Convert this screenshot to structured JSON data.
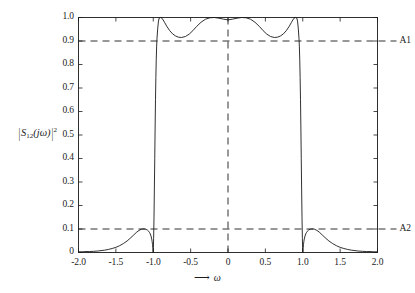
{
  "figure": {
    "background_color": "#ffffff",
    "line_color": "#1a1a1a",
    "text_color": "#1b1b1b"
  },
  "axes": {
    "y_label_parts": {
      "open_bar": "|",
      "s": "S",
      "subscript": "12",
      "arg": "(jω)",
      "close_bar": "|",
      "exponent": "2"
    },
    "x_label_arrow": "⟶",
    "x_label_symbol": "ω"
  },
  "annotations": [
    {
      "name": "A1",
      "label": "A1",
      "y_value": 0.9
    },
    {
      "name": "A2",
      "label": "A2",
      "y_value": 0.1
    }
  ],
  "chart_data": {
    "type": "line",
    "title": "",
    "xlabel": "ω",
    "ylabel": "|S12(jω)|^2",
    "xlim": [
      -2.0,
      2.0
    ],
    "ylim": [
      0.0,
      1.0
    ],
    "grid": false,
    "legend": null,
    "xticks": [
      -2.0,
      -1.5,
      -1.0,
      -0.5,
      0,
      0.5,
      1.0,
      1.5,
      2.0
    ],
    "xtick_labels": [
      "-2.0",
      "-1.5",
      "-1.0",
      "-0.5",
      "0",
      "0.5",
      "1.0",
      "1.5",
      "2.0"
    ],
    "yticks": [
      0,
      0.1,
      0.2,
      0.3,
      0.4,
      0.5,
      0.6,
      0.7,
      0.8,
      0.9,
      1.0
    ],
    "ytick_labels": [
      "0",
      "0.1",
      "0.2",
      "0.3",
      "0.4",
      "0.5",
      "0.6",
      "0.7",
      "0.8",
      "0.9",
      "1.0"
    ],
    "reference_lines": [
      {
        "name": "A1",
        "orientation": "horizontal",
        "value": 0.9,
        "style": "dashed"
      },
      {
        "name": "A2",
        "orientation": "horizontal",
        "value": 0.1,
        "style": "dashed"
      },
      {
        "name": "omega-zero",
        "orientation": "vertical",
        "value": 0,
        "style": "dashed"
      }
    ],
    "series": [
      {
        "name": "|S12(jw)|^2",
        "style": "solid",
        "x": [
          -2.0,
          -1.95,
          -1.9,
          -1.85,
          -1.8,
          -1.75,
          -1.7,
          -1.65,
          -1.6,
          -1.55,
          -1.5,
          -1.45,
          -1.4,
          -1.35,
          -1.3,
          -1.26,
          -1.22,
          -1.19,
          -1.16,
          -1.14,
          -1.12,
          -1.1,
          -1.08,
          -1.06,
          -1.05,
          -1.04,
          -1.03,
          -1.02,
          -1.015,
          -1.01,
          -1.005,
          -1.0,
          -0.998,
          -0.995,
          -0.99,
          -0.985,
          -0.98,
          -0.975,
          -0.97,
          -0.965,
          -0.96,
          -0.955,
          -0.95,
          -0.94,
          -0.93,
          -0.92,
          -0.9,
          -0.88,
          -0.85,
          -0.82,
          -0.78,
          -0.74,
          -0.7,
          -0.66,
          -0.62,
          -0.57,
          -0.52,
          -0.47,
          -0.42,
          -0.36,
          -0.3,
          -0.24,
          -0.18,
          -0.12,
          -0.06,
          0.0,
          0.06,
          0.12,
          0.18,
          0.24,
          0.3,
          0.36,
          0.42,
          0.47,
          0.52,
          0.57,
          0.62,
          0.66,
          0.7,
          0.74,
          0.78,
          0.82,
          0.85,
          0.88,
          0.9,
          0.92,
          0.93,
          0.94,
          0.95,
          0.955,
          0.96,
          0.965,
          0.97,
          0.975,
          0.98,
          0.985,
          0.99,
          0.995,
          0.998,
          1.0,
          1.005,
          1.01,
          1.015,
          1.02,
          1.03,
          1.04,
          1.05,
          1.06,
          1.08,
          1.1,
          1.12,
          1.14,
          1.16,
          1.19,
          1.22,
          1.26,
          1.3,
          1.35,
          1.4,
          1.45,
          1.5,
          1.55,
          1.6,
          1.65,
          1.7,
          1.75,
          1.8,
          1.85,
          1.9,
          1.95,
          2.0
        ],
        "y": [
          0.003,
          0.003,
          0.004,
          0.004,
          0.005,
          0.006,
          0.008,
          0.01,
          0.013,
          0.017,
          0.022,
          0.029,
          0.038,
          0.049,
          0.063,
          0.075,
          0.087,
          0.094,
          0.099,
          0.1,
          0.1,
          0.099,
          0.096,
          0.09,
          0.085,
          0.079,
          0.07,
          0.057,
          0.047,
          0.034,
          0.018,
          0.0,
          0.02,
          0.06,
          0.15,
          0.27,
          0.4,
          0.53,
          0.65,
          0.745,
          0.82,
          0.875,
          0.91,
          0.955,
          0.985,
          0.998,
          1.0,
          0.996,
          0.98,
          0.963,
          0.944,
          0.93,
          0.921,
          0.916,
          0.915,
          0.919,
          0.929,
          0.944,
          0.962,
          0.98,
          0.993,
          0.999,
          1.0,
          0.997,
          0.993,
          0.99,
          0.993,
          0.997,
          1.0,
          0.999,
          0.993,
          0.98,
          0.962,
          0.944,
          0.929,
          0.919,
          0.915,
          0.916,
          0.921,
          0.93,
          0.944,
          0.963,
          0.98,
          0.996,
          1.0,
          0.998,
          0.985,
          0.955,
          0.91,
          0.875,
          0.82,
          0.745,
          0.65,
          0.53,
          0.4,
          0.27,
          0.15,
          0.06,
          0.02,
          0.0,
          0.018,
          0.034,
          0.047,
          0.057,
          0.07,
          0.079,
          0.085,
          0.09,
          0.096,
          0.099,
          0.1,
          0.1,
          0.099,
          0.094,
          0.087,
          0.075,
          0.063,
          0.049,
          0.038,
          0.029,
          0.022,
          0.017,
          0.013,
          0.01,
          0.008,
          0.006,
          0.005,
          0.004,
          0.004,
          0.003,
          0.003
        ]
      }
    ],
    "notes": {
      "passband_ripple_min": 0.9,
      "passband_max": 1.0,
      "stopband_max": 0.1,
      "passband_edges": [
        -1.0,
        1.0
      ],
      "transmission_zeros": [
        -1.0,
        1.0
      ]
    }
  }
}
